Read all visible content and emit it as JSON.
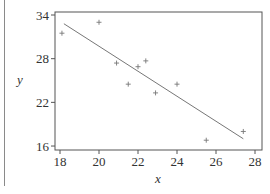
{
  "chart_data": {
    "type": "scatter",
    "title": "",
    "xlabel": "x",
    "ylabel": "y",
    "xlim": [
      17.7,
      28.3
    ],
    "ylim": [
      15.5,
      34.5
    ],
    "x_ticks": [
      18,
      20,
      22,
      24,
      26,
      28
    ],
    "y_ticks": [
      16,
      22,
      28,
      34
    ],
    "grid": false,
    "legend": null,
    "series": [
      {
        "name": "observations",
        "marker": "+",
        "points": [
          {
            "x": 18.1,
            "y": 31.5
          },
          {
            "x": 20.0,
            "y": 33.0
          },
          {
            "x": 20.9,
            "y": 27.4
          },
          {
            "x": 21.5,
            "y": 24.5
          },
          {
            "x": 22.0,
            "y": 26.9
          },
          {
            "x": 22.4,
            "y": 27.7
          },
          {
            "x": 22.9,
            "y": 23.3
          },
          {
            "x": 24.0,
            "y": 24.5
          },
          {
            "x": 25.5,
            "y": 16.8
          },
          {
            "x": 27.4,
            "y": 18.0
          }
        ]
      },
      {
        "name": "fitted line",
        "type": "line",
        "points": [
          {
            "x": 18.2,
            "y": 32.8
          },
          {
            "x": 27.4,
            "y": 17.0
          }
        ]
      }
    ]
  },
  "colors": {
    "axis": "#555555",
    "points": "#777777",
    "line": "#666666",
    "text": "#333333"
  }
}
